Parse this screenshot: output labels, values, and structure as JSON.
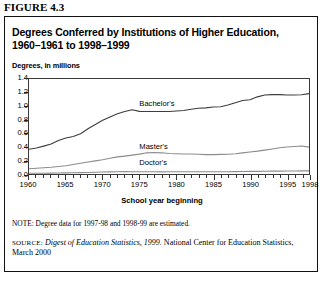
{
  "figure": {
    "label": "FIGURE 4.3",
    "title_line1": "Degrees Conferred by Institutions of Higher Education,",
    "title_line2": "1960–1961 to 1998–1999",
    "subtitle": "Degrees, in millions",
    "note": "NOTE: Degree data for 1997-98 and 1998-99 are estimated.",
    "source_prefix": "SOURCE:",
    "source_italic": "Digest of Education Statistics, 1999.",
    "source_rest": "National Center for Education Statistics, March 2000"
  },
  "chart_data": {
    "type": "line",
    "title": "Degrees Conferred by Institutions of Higher Education, 1960–1961 to 1998–1999",
    "subtitle": "Degrees, in millions",
    "xlabel": "School year beginning",
    "ylabel": "",
    "xlim": [
      1960,
      1998
    ],
    "ylim": [
      0.0,
      1.4
    ],
    "yticks": [
      "0.0",
      "0.2",
      "0.4",
      "0.6",
      "0.8",
      "1.0",
      "1.2",
      "1.4"
    ],
    "ytick_values": [
      0.0,
      0.2,
      0.4,
      0.6,
      0.8,
      1.0,
      1.2,
      1.4
    ],
    "xticks": [
      "1960",
      "1965",
      "1970",
      "1975",
      "1980",
      "1985",
      "1990",
      "1995",
      "1998"
    ],
    "xtick_values": [
      1960,
      1965,
      1970,
      1975,
      1980,
      1985,
      1990,
      1995,
      1998
    ],
    "grid": false,
    "legend": "inline-labels",
    "x": [
      1960,
      1961,
      1962,
      1963,
      1964,
      1965,
      1966,
      1967,
      1968,
      1969,
      1970,
      1971,
      1972,
      1973,
      1974,
      1975,
      1976,
      1977,
      1978,
      1979,
      1980,
      1981,
      1982,
      1983,
      1984,
      1985,
      1986,
      1987,
      1988,
      1989,
      1990,
      1991,
      1992,
      1993,
      1994,
      1995,
      1996,
      1997,
      1998
    ],
    "series": [
      {
        "name": "Bachelor's",
        "color": "#3d3d3d",
        "values": [
          0.365,
          0.383,
          0.411,
          0.441,
          0.494,
          0.531,
          0.552,
          0.594,
          0.667,
          0.729,
          0.792,
          0.84,
          0.887,
          0.922,
          0.946,
          0.923,
          0.92,
          0.921,
          0.921,
          0.92,
          0.929,
          0.935,
          0.953,
          0.969,
          0.974,
          0.988,
          0.992,
          1.016,
          1.051,
          1.082,
          1.094,
          1.137,
          1.165,
          1.169,
          1.17,
          1.165,
          1.164,
          1.168,
          1.184
        ]
      },
      {
        "name": "Master's",
        "color": "#8c8c8c",
        "values": [
          0.078,
          0.085,
          0.092,
          0.099,
          0.11,
          0.122,
          0.141,
          0.158,
          0.177,
          0.194,
          0.209,
          0.231,
          0.252,
          0.264,
          0.278,
          0.293,
          0.312,
          0.317,
          0.312,
          0.302,
          0.298,
          0.295,
          0.295,
          0.29,
          0.285,
          0.286,
          0.289,
          0.29,
          0.299,
          0.311,
          0.325,
          0.337,
          0.352,
          0.369,
          0.387,
          0.398,
          0.406,
          0.412,
          0.396
        ]
      },
      {
        "name": "Doctor's",
        "color": "#8c8c8c",
        "values": [
          0.01,
          0.011,
          0.012,
          0.013,
          0.015,
          0.017,
          0.018,
          0.021,
          0.023,
          0.026,
          0.03,
          0.032,
          0.034,
          0.035,
          0.034,
          0.034,
          0.034,
          0.033,
          0.032,
          0.033,
          0.033,
          0.033,
          0.033,
          0.033,
          0.033,
          0.033,
          0.034,
          0.034,
          0.035,
          0.036,
          0.038,
          0.039,
          0.04,
          0.042,
          0.043,
          0.044,
          0.045,
          0.046,
          0.046
        ]
      }
    ],
    "annotations": [
      {
        "text": "Bachelor's",
        "x": 1975,
        "y": 1.02
      },
      {
        "text": "Master's",
        "x": 1975,
        "y": 0.4
      },
      {
        "text": "Doctor's",
        "x": 1975,
        "y": 0.17
      }
    ]
  }
}
